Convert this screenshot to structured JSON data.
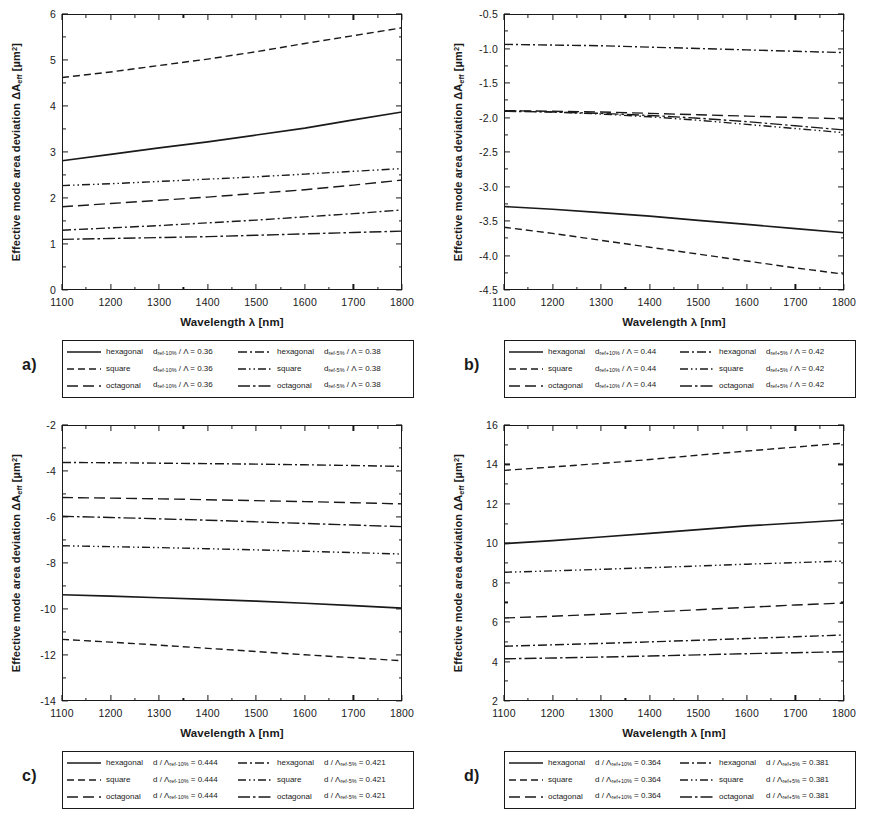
{
  "figure": {
    "axis_labels": {
      "x": "Wavelength λ [nm]",
      "y_prefix": "Effective mode area deviation ΔA",
      "y_sub": "eff",
      "y_unit": " [µm",
      "y_sup": "2",
      "y_unit_close": "]"
    },
    "x_ticks": [
      "1100",
      "1200",
      "1300",
      "1400",
      "1500",
      "1600",
      "1700",
      "1800"
    ],
    "line_styles": {
      "solid": "solid",
      "dashed": "dashed",
      "long-dash": "long-dash",
      "dash-dot": "dash-dot",
      "dash-dot-dot": "dash-dot-dot",
      "long-dash-dot": "long-dash-dot"
    }
  },
  "panels": [
    {
      "id": "a",
      "label": "a)",
      "y_ticks": [
        "6",
        "5",
        "4",
        "3",
        "2",
        "1",
        "0"
      ],
      "legend": [
        {
          "shape": "hexagonal",
          "expr_d": "d",
          "expr_sub": "ref-10%",
          "expr_den": "Λ",
          "value": "0.36",
          "style": "solid"
        },
        {
          "shape": "hexagonal",
          "expr_d": "d",
          "expr_sub": "ref-5%",
          "expr_den": "Λ",
          "value": "0.38",
          "style": "dash-dot"
        },
        {
          "shape": "square",
          "expr_d": "d",
          "expr_sub": "ref-10%",
          "expr_den": "Λ",
          "value": "0.36",
          "style": "dashed"
        },
        {
          "shape": "square",
          "expr_d": "d",
          "expr_sub": "ref-5%",
          "expr_den": "Λ",
          "value": "0.38",
          "style": "dash-dot-dot"
        },
        {
          "shape": "octagonal",
          "expr_d": "d",
          "expr_sub": "ref-10%",
          "expr_den": "Λ",
          "value": "0.36",
          "style": "long-dash"
        },
        {
          "shape": "octagonal",
          "expr_d": "d",
          "expr_sub": "ref-5%",
          "expr_den": "Λ",
          "value": "0.38",
          "style": "long-dash-dot"
        }
      ]
    },
    {
      "id": "b",
      "label": "b)",
      "y_ticks": [
        "-0.5",
        "-1.0",
        "-1.5",
        "-2.0",
        "-2.5",
        "-3.0",
        "-3.5",
        "-4.0",
        "-4.5"
      ],
      "legend": [
        {
          "shape": "hexagonal",
          "expr_d": "d",
          "expr_sub": "ref+10%",
          "expr_den": "Λ",
          "value": "0.44",
          "style": "solid"
        },
        {
          "shape": "hexagonal",
          "expr_d": "d",
          "expr_sub": "ref+5%",
          "expr_den": "Λ",
          "value": "0.42",
          "style": "dash-dot"
        },
        {
          "shape": "square",
          "expr_d": "d",
          "expr_sub": "ref+10%",
          "expr_den": "Λ",
          "value": "0.44",
          "style": "dashed"
        },
        {
          "shape": "square",
          "expr_d": "d",
          "expr_sub": "ref+5%",
          "expr_den": "Λ",
          "value": "0.42",
          "style": "dash-dot-dot"
        },
        {
          "shape": "octagonal",
          "expr_d": "d",
          "expr_sub": "ref+10%",
          "expr_den": "Λ",
          "value": "0.44",
          "style": "long-dash"
        },
        {
          "shape": "octagonal",
          "expr_d": "d",
          "expr_sub": "ref+5%",
          "expr_den": "Λ",
          "value": "0.42",
          "style": "long-dash-dot"
        }
      ]
    },
    {
      "id": "c",
      "label": "c)",
      "y_ticks": [
        "-2",
        "-4",
        "-6",
        "-8",
        "-10",
        "-12",
        "-14"
      ],
      "legend": [
        {
          "shape": "hexagonal",
          "expr_d": "d",
          "expr_den": "Λ",
          "expr_sub": "ref-10%",
          "value": "0.444",
          "style": "solid",
          "sub_on_den": true
        },
        {
          "shape": "hexagonal",
          "expr_d": "d",
          "expr_den": "Λ",
          "expr_sub": "ref-5%",
          "value": "0.421",
          "style": "dash-dot",
          "sub_on_den": true
        },
        {
          "shape": "square",
          "expr_d": "d",
          "expr_den": "Λ",
          "expr_sub": "ref-10%",
          "value": "0.444",
          "style": "dashed",
          "sub_on_den": true
        },
        {
          "shape": "square",
          "expr_d": "d",
          "expr_den": "Λ",
          "expr_sub": "ref-5%",
          "value": "0.421",
          "style": "dash-dot-dot",
          "sub_on_den": true
        },
        {
          "shape": "octagonal",
          "expr_d": "d",
          "expr_den": "Λ",
          "expr_sub": "ref-10%",
          "value": "0.444",
          "style": "long-dash",
          "sub_on_den": true
        },
        {
          "shape": "octagonal",
          "expr_d": "d",
          "expr_den": "Λ",
          "expr_sub": "ref-5%",
          "value": "0.421",
          "style": "long-dash-dot",
          "sub_on_den": true
        }
      ]
    },
    {
      "id": "d",
      "label": "d)",
      "y_ticks": [
        "16",
        "14",
        "12",
        "10",
        "8",
        "6",
        "4",
        "2"
      ],
      "legend": [
        {
          "shape": "hexagonal",
          "expr_d": "d",
          "expr_den": "Λ",
          "expr_sub": "ref+10%",
          "value": "0.364",
          "style": "solid",
          "sub_on_den": true
        },
        {
          "shape": "hexagonal",
          "expr_d": "d",
          "expr_den": "Λ",
          "expr_sub": "ref+5%",
          "value": "0.381",
          "style": "dash-dot",
          "sub_on_den": true
        },
        {
          "shape": "square",
          "expr_d": "d",
          "expr_den": "Λ",
          "expr_sub": "ref+10%",
          "value": "0.364",
          "style": "dashed",
          "sub_on_den": true
        },
        {
          "shape": "square",
          "expr_d": "d",
          "expr_den": "Λ",
          "expr_sub": "ref+5%",
          "value": "0.381",
          "style": "dash-dot-dot",
          "sub_on_den": true
        },
        {
          "shape": "octagonal",
          "expr_d": "d",
          "expr_den": "Λ",
          "expr_sub": "ref+10%",
          "value": "0.364",
          "style": "long-dash",
          "sub_on_den": true
        },
        {
          "shape": "octagonal",
          "expr_d": "d",
          "expr_den": "Λ",
          "expr_sub": "ref+5%",
          "value": "0.381",
          "style": "long-dash-dot",
          "sub_on_den": true
        }
      ]
    }
  ],
  "chart_data": [
    {
      "type": "line",
      "panel": "a",
      "title": "",
      "xlabel": "Wavelength λ [nm]",
      "ylabel": "Effective mode area deviation ΔA_eff [µm²]",
      "xlim": [
        1100,
        1800
      ],
      "ylim": [
        0,
        6
      ],
      "xticks": [
        1100,
        1200,
        1300,
        1400,
        1500,
        1600,
        1700,
        1800
      ],
      "yticks": [
        0,
        1,
        2,
        3,
        4,
        5,
        6
      ],
      "grid": false,
      "legend_position": "below-axes",
      "x": [
        1100,
        1200,
        1300,
        1400,
        1500,
        1600,
        1700,
        1800
      ],
      "series": [
        {
          "name": "square d_ref-10% / Λ = 0.36",
          "style": "dashed",
          "values": [
            4.62,
            4.74,
            4.88,
            5.02,
            5.18,
            5.36,
            5.53,
            5.7
          ]
        },
        {
          "name": "hexagonal d_ref-10% / Λ = 0.36",
          "style": "solid",
          "values": [
            2.81,
            2.95,
            3.09,
            3.22,
            3.37,
            3.52,
            3.7,
            3.87
          ]
        },
        {
          "name": "square d_ref-5% / Λ = 0.38",
          "style": "dash-dot-dot",
          "values": [
            2.27,
            2.31,
            2.36,
            2.41,
            2.46,
            2.52,
            2.58,
            2.64
          ]
        },
        {
          "name": "octagonal d_ref-10% / Λ = 0.36",
          "style": "long-dash",
          "values": [
            1.81,
            1.88,
            1.95,
            2.02,
            2.1,
            2.18,
            2.28,
            2.39
          ]
        },
        {
          "name": "hexagonal d_ref-5% / Λ = 0.38",
          "style": "dash-dot",
          "values": [
            1.3,
            1.35,
            1.4,
            1.46,
            1.52,
            1.59,
            1.66,
            1.74
          ]
        },
        {
          "name": "octagonal d_ref-5% / Λ = 0.38",
          "style": "long-dash-dot",
          "values": [
            1.1,
            1.12,
            1.14,
            1.16,
            1.19,
            1.22,
            1.25,
            1.28
          ]
        }
      ]
    },
    {
      "type": "line",
      "panel": "b",
      "title": "",
      "xlabel": "Wavelength λ [nm]",
      "ylabel": "Effective mode area deviation ΔA_eff [µm²]",
      "xlim": [
        1100,
        1800
      ],
      "ylim": [
        -4.5,
        -0.5
      ],
      "xticks": [
        1100,
        1200,
        1300,
        1400,
        1500,
        1600,
        1700,
        1800
      ],
      "yticks": [
        -4.5,
        -4.0,
        -3.5,
        -3.0,
        -2.5,
        -2.0,
        -1.5,
        -1.0,
        -0.5
      ],
      "grid": false,
      "legend_position": "below-axes",
      "x": [
        1100,
        1200,
        1300,
        1400,
        1500,
        1600,
        1700,
        1800
      ],
      "series": [
        {
          "name": "hexagonal d_ref+5% / Λ = 0.42",
          "style": "dash-dot",
          "values": [
            -0.94,
            -0.95,
            -0.96,
            -0.98,
            -1.0,
            -1.02,
            -1.04,
            -1.06
          ]
        },
        {
          "name": "octagonal d_ref+10% / Λ = 0.44",
          "style": "long-dash",
          "values": [
            -1.9,
            -1.91,
            -1.92,
            -1.94,
            -1.96,
            -1.98,
            -2.0,
            -2.02
          ]
        },
        {
          "name": "octagonal d_ref+5% / Λ = 0.42",
          "style": "long-dash-dot",
          "values": [
            -1.91,
            -1.92,
            -1.94,
            -1.97,
            -2.01,
            -2.06,
            -2.12,
            -2.18
          ]
        },
        {
          "name": "square d_ref+5% / Λ = 0.42",
          "style": "dash-dot-dot",
          "values": [
            -1.9,
            -1.92,
            -1.95,
            -1.99,
            -2.04,
            -2.1,
            -2.16,
            -2.22
          ]
        },
        {
          "name": "hexagonal d_ref+10% / Λ = 0.44",
          "style": "solid",
          "values": [
            -3.29,
            -3.33,
            -3.38,
            -3.43,
            -3.49,
            -3.55,
            -3.61,
            -3.67
          ]
        },
        {
          "name": "square d_ref+10% / Λ = 0.44",
          "style": "dashed",
          "values": [
            -3.59,
            -3.68,
            -3.78,
            -3.88,
            -3.98,
            -4.08,
            -4.18,
            -4.27
          ]
        }
      ]
    },
    {
      "type": "line",
      "panel": "c",
      "title": "",
      "xlabel": "Wavelength λ [nm]",
      "ylabel": "Effective mode area deviation ΔA_eff [µm²]",
      "xlim": [
        1100,
        1800
      ],
      "ylim": [
        -14,
        -2
      ],
      "xticks": [
        1100,
        1200,
        1300,
        1400,
        1500,
        1600,
        1700,
        1800
      ],
      "yticks": [
        -14,
        -12,
        -10,
        -8,
        -6,
        -4,
        -2
      ],
      "grid": false,
      "legend_position": "below-axes",
      "x": [
        1100,
        1200,
        1300,
        1400,
        1500,
        1600,
        1700,
        1800
      ],
      "series": [
        {
          "name": "hexagonal d / Λ_ref-5% = 0.421",
          "style": "dash-dot",
          "values": [
            -3.63,
            -3.64,
            -3.66,
            -3.68,
            -3.7,
            -3.73,
            -3.76,
            -3.8
          ]
        },
        {
          "name": "octagonal d / Λ_ref-10% = 0.444",
          "style": "long-dash",
          "values": [
            -5.15,
            -5.18,
            -5.21,
            -5.25,
            -5.29,
            -5.33,
            -5.38,
            -5.43
          ]
        },
        {
          "name": "octagonal d / Λ_ref-5% = 0.421",
          "style": "long-dash-dot",
          "values": [
            -5.97,
            -6.02,
            -6.08,
            -6.14,
            -6.21,
            -6.28,
            -6.35,
            -6.42
          ]
        },
        {
          "name": "square d / Λ_ref-5% = 0.421",
          "style": "dash-dot-dot",
          "values": [
            -7.25,
            -7.29,
            -7.33,
            -7.38,
            -7.43,
            -7.49,
            -7.55,
            -7.61
          ]
        },
        {
          "name": "hexagonal d / Λ_ref-10% = 0.444",
          "style": "solid",
          "values": [
            -9.38,
            -9.44,
            -9.51,
            -9.58,
            -9.66,
            -9.75,
            -9.85,
            -9.96
          ]
        },
        {
          "name": "square d / Λ_ref-10% = 0.444",
          "style": "dashed",
          "values": [
            -11.32,
            -11.44,
            -11.57,
            -11.71,
            -11.85,
            -11.99,
            -12.12,
            -12.25
          ]
        }
      ]
    },
    {
      "type": "line",
      "panel": "d",
      "title": "",
      "xlabel": "Wavelength λ [nm]",
      "ylabel": "Effective mode area deviation ΔA_eff [µm²]",
      "xlim": [
        1100,
        1800
      ],
      "ylim": [
        2,
        16
      ],
      "xticks": [
        1100,
        1200,
        1300,
        1400,
        1500,
        1600,
        1700,
        1800
      ],
      "yticks": [
        2,
        4,
        6,
        8,
        10,
        12,
        14,
        16
      ],
      "grid": false,
      "legend_position": "below-axes",
      "x": [
        1100,
        1200,
        1300,
        1400,
        1500,
        1600,
        1700,
        1800
      ],
      "series": [
        {
          "name": "square d / Λ_ref+10% = 0.364",
          "style": "dashed",
          "values": [
            13.7,
            13.87,
            14.05,
            14.25,
            14.47,
            14.68,
            14.88,
            15.08
          ]
        },
        {
          "name": "hexagonal d / Λ_ref+10% = 0.364",
          "style": "solid",
          "values": [
            9.98,
            10.14,
            10.32,
            10.5,
            10.69,
            10.88,
            11.03,
            11.18
          ]
        },
        {
          "name": "square d / Λ_ref+5% = 0.381",
          "style": "dash-dot-dot",
          "values": [
            8.53,
            8.6,
            8.68,
            8.76,
            8.85,
            8.94,
            9.02,
            9.1
          ]
        },
        {
          "name": "octagonal d / Λ_ref+10% = 0.364",
          "style": "long-dash",
          "values": [
            6.21,
            6.3,
            6.4,
            6.51,
            6.63,
            6.75,
            6.87,
            6.97
          ]
        },
        {
          "name": "hexagonal d / Λ_ref+5% = 0.381",
          "style": "dash-dot",
          "values": [
            4.78,
            4.85,
            4.92,
            5.0,
            5.08,
            5.17,
            5.26,
            5.35
          ]
        },
        {
          "name": "octagonal d / Λ_ref+5% = 0.381",
          "style": "long-dash-dot",
          "values": [
            4.14,
            4.18,
            4.23,
            4.28,
            4.34,
            4.4,
            4.45,
            4.5
          ]
        }
      ]
    }
  ]
}
